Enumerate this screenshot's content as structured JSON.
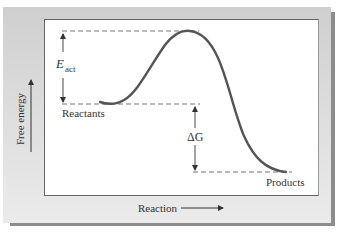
{
  "diagram": {
    "labels": {
      "y_axis": "Free energy",
      "x_axis": "Reaction",
      "activation_energy_main": "E",
      "activation_energy_sub": "act",
      "delta_g": "ΔG",
      "reactants": "Reactants",
      "products": "Products"
    },
    "levels": {
      "transition_state_y": 31,
      "reactants_y": 104,
      "products_y": 172
    },
    "colors": {
      "panel_bg": "#d9d9d9",
      "plot_bg": "#ffffff",
      "curve": "#555555",
      "dashes": "#777777",
      "text": "#333333",
      "shadow": "#8c8c8c"
    }
  }
}
